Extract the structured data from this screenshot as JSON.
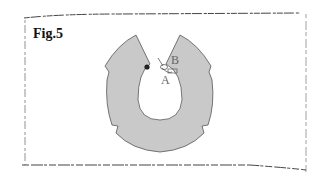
{
  "figure": {
    "title": "Fig.5",
    "labels": {
      "point_a": "A",
      "point_b": "B"
    }
  },
  "colors": {
    "background": "#ffffff",
    "shape_fill": "#c9c9c9",
    "shape_stroke": "#555555",
    "border": "#444444",
    "dot": "#222222"
  }
}
